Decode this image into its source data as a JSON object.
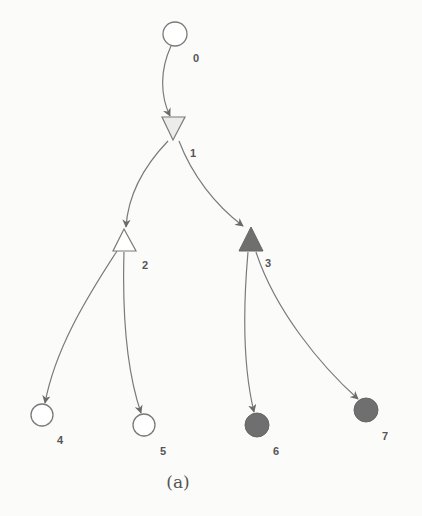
{
  "caption": "(a)",
  "colors": {
    "background": "#fbfbf9",
    "stroke": "#7a7a7a",
    "filled_node": "#6f6f6f",
    "open_node": "#ffffff",
    "light_triangle": "#ececec",
    "label": "#555555"
  },
  "nodes": [
    {
      "id": "0",
      "label": "0",
      "shape": "circle",
      "filled": false
    },
    {
      "id": "1",
      "label": "1",
      "shape": "triangle-down",
      "filled": false
    },
    {
      "id": "2",
      "label": "2",
      "shape": "triangle-up",
      "filled": false
    },
    {
      "id": "3",
      "label": "3",
      "shape": "triangle-up",
      "filled": true
    },
    {
      "id": "4",
      "label": "4",
      "shape": "circle",
      "filled": false
    },
    {
      "id": "5",
      "label": "5",
      "shape": "circle",
      "filled": false
    },
    {
      "id": "6",
      "label": "6",
      "shape": "circle",
      "filled": true
    },
    {
      "id": "7",
      "label": "7",
      "shape": "circle",
      "filled": true
    }
  ],
  "edges": [
    {
      "from": "0",
      "to": "1"
    },
    {
      "from": "1",
      "to": "2"
    },
    {
      "from": "1",
      "to": "3"
    },
    {
      "from": "2",
      "to": "4"
    },
    {
      "from": "2",
      "to": "5"
    },
    {
      "from": "3",
      "to": "6"
    },
    {
      "from": "3",
      "to": "7"
    }
  ]
}
